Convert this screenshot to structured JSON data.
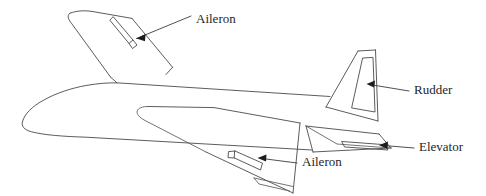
{
  "figure": {
    "kind": "technical-line-diagram",
    "background_color": "#ffffff",
    "line_color": "#4a4a4a",
    "text_color": "#262626",
    "arrow_color": "#1d1d1d",
    "width": 486,
    "height": 196
  },
  "labels": {
    "aileron_far": "Aileron",
    "rudder": "Rudder",
    "elevator": "Elevator",
    "aileron_near": "Aileron"
  },
  "parts": {
    "fuselage": "fuselage",
    "far_wing": "far-wing",
    "near_wing": "near-wing",
    "vertical_stabilizer": "vertical-stabilizer",
    "horizontal_stabilizer": "horizontal-stabilizer",
    "aileron_far_surface": "far-wing-aileron-surface",
    "aileron_near_surface": "near-wing-aileron-surface",
    "rudder_surface": "rudder-surface",
    "elevator_surface": "elevator-surface"
  },
  "callouts": [
    {
      "name": "aileron-far",
      "label": "Aileron",
      "text_x": 196,
      "text_y": 20
    },
    {
      "name": "rudder",
      "label": "Rudder",
      "text_x": 414,
      "text_y": 91
    },
    {
      "name": "elevator",
      "label": "Elevator",
      "text_x": 419,
      "text_y": 148
    },
    {
      "name": "aileron-near",
      "label": "Aileron",
      "text_x": 302,
      "text_y": 163
    }
  ]
}
